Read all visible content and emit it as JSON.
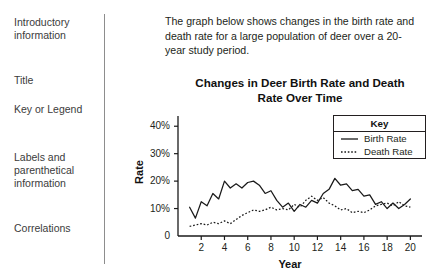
{
  "sidebar": {
    "items": [
      {
        "label": "Introductory\ninformation",
        "top": 16
      },
      {
        "label": "Title",
        "top": 74
      },
      {
        "label": "Key or\nLegend",
        "top": 103
      },
      {
        "label": "Labels and\nparenthetical\ninformation",
        "top": 151
      },
      {
        "label": "Correlations",
        "top": 222
      }
    ]
  },
  "intro": {
    "text": "The graph below shows changes in the birth rate and death rate for a large population of deer over a 20-year study period."
  },
  "chart_data": {
    "type": "line",
    "title": "Changes in Deer Birth Rate and Death Rate Over Time",
    "xlabel": "Year",
    "ylabel": "Rate",
    "xlim": [
      0,
      21
    ],
    "ylim": [
      0,
      43
    ],
    "grid": false,
    "legend_position": "top-right",
    "legend_title": "Key",
    "ytick_labels": [
      "0",
      "10%",
      "20%",
      "30%",
      "40%"
    ],
    "ytick_values": [
      0,
      10,
      20,
      30,
      40
    ],
    "xtick_labels": [
      "2",
      "4",
      "6",
      "8",
      "10",
      "12",
      "14",
      "16",
      "18",
      "20"
    ],
    "xtick_values": [
      2,
      4,
      6,
      8,
      10,
      12,
      14,
      16,
      18,
      20
    ],
    "x": [
      1,
      1.5,
      2,
      2.5,
      3,
      3.5,
      4,
      4.5,
      5,
      5.5,
      6,
      6.5,
      7,
      7.5,
      8,
      8.5,
      9,
      9.5,
      10,
      10.5,
      11,
      11.5,
      12,
      12.5,
      13,
      13.5,
      14,
      14.5,
      15,
      15.5,
      16,
      16.5,
      17,
      17.5,
      18,
      18.5,
      19,
      19.5,
      20
    ],
    "series": [
      {
        "name": "Birth Rate",
        "style": "solid",
        "color": "#1a1a1a",
        "values": [
          10.5,
          6.5,
          12.5,
          11,
          15.5,
          13.5,
          20,
          17.5,
          19,
          17.5,
          19.5,
          20,
          18.5,
          15.5,
          16.5,
          13,
          10.5,
          12,
          9,
          11.5,
          10.5,
          13,
          12,
          15.5,
          17,
          21,
          18.5,
          19,
          16.5,
          17,
          14.5,
          15,
          11.5,
          12.5,
          10,
          12,
          10,
          11.5,
          13.5
        ]
      },
      {
        "name": "Death Rate",
        "style": "dotted",
        "color": "#1a1a1a",
        "values": [
          3.5,
          4,
          4.5,
          4,
          5,
          4.5,
          5.5,
          4.5,
          6,
          7.5,
          8.5,
          9.5,
          9,
          9.5,
          10.5,
          9.5,
          10,
          9.5,
          11.5,
          10.5,
          13,
          14.5,
          13,
          14,
          12,
          11,
          9.5,
          10,
          8.5,
          9,
          8.5,
          9.5,
          11,
          11.5,
          12,
          11,
          12.5,
          11,
          10.5
        ]
      }
    ]
  }
}
